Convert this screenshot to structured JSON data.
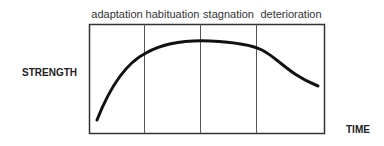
{
  "diagram": {
    "phases": [
      {
        "label": "adaptation"
      },
      {
        "label": "habituation"
      },
      {
        "label": "stagnation"
      },
      {
        "label": "deterioration"
      }
    ],
    "y_axis_label": "STRENGTH",
    "x_axis_label": "TIME",
    "curve_description": "Strength rises steeply during adaptation, plateaus through habituation and stagnation, then declines during deterioration"
  }
}
